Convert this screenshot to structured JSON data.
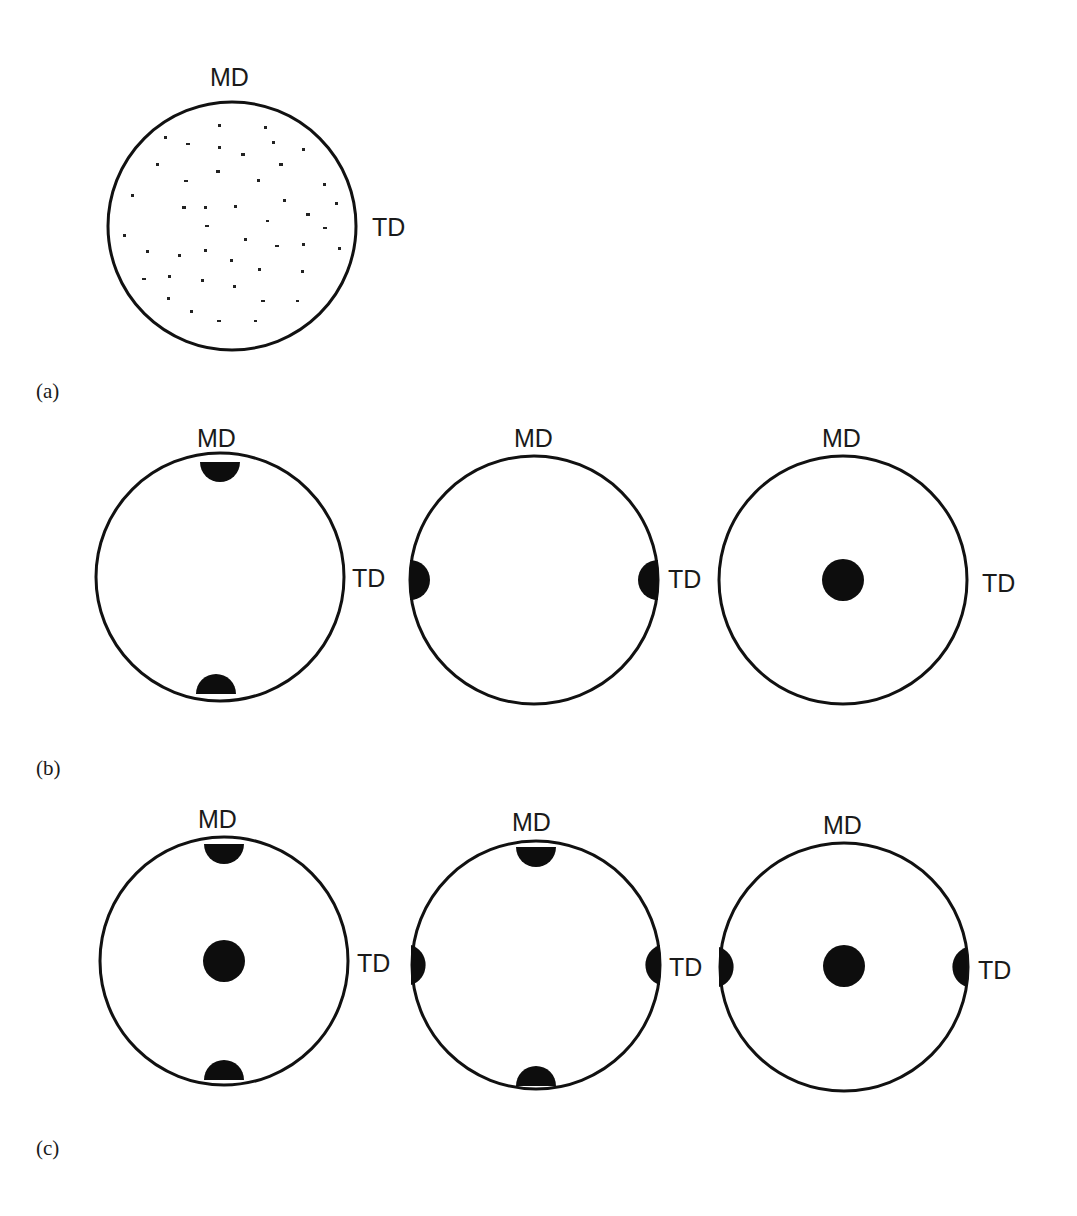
{
  "figure": {
    "panels": [
      {
        "id": "a",
        "caption": "(a)",
        "description": "Random orientation: scattered points, no preferred orientation",
        "circles": [
          {
            "center": [
              232,
              226
            ],
            "radius": 124,
            "md_label": "MD",
            "td_label": "TD",
            "poles": [],
            "scattered_points": true
          }
        ]
      },
      {
        "id": "b",
        "caption": "(b)",
        "description": "Uniaxial orientations",
        "circles": [
          {
            "center": [
              220,
              577
            ],
            "radius": 124,
            "md_label": "MD",
            "td_label": "TD",
            "poles": [
              "top",
              "bottom"
            ]
          },
          {
            "center": [
              534,
              580
            ],
            "radius": 124,
            "md_label": "MD",
            "td_label": "TD",
            "poles": [
              "left",
              "right"
            ]
          },
          {
            "center": [
              843,
              580
            ],
            "radius": 124,
            "md_label": "MD",
            "td_label": "TD",
            "poles": [
              "center"
            ]
          }
        ]
      },
      {
        "id": "c",
        "caption": "(c)",
        "description": "Biaxial orientations",
        "circles": [
          {
            "center": [
              224,
              961
            ],
            "radius": 124,
            "md_label": "MD",
            "td_label": "TD",
            "poles": [
              "top",
              "bottom",
              "center"
            ]
          },
          {
            "center": [
              536,
              965
            ],
            "radius": 124,
            "md_label": "MD",
            "td_label": "TD",
            "poles": [
              "top",
              "bottom",
              "left",
              "right"
            ]
          },
          {
            "center": [
              844,
              967
            ],
            "radius": 124,
            "md_label": "MD",
            "td_label": "TD",
            "poles": [
              "left",
              "right",
              "center"
            ]
          }
        ]
      }
    ],
    "labels": {
      "machine_direction": "MD",
      "transverse_direction": "TD"
    },
    "colors": {
      "ink": "#111111",
      "background": "#ffffff"
    }
  }
}
